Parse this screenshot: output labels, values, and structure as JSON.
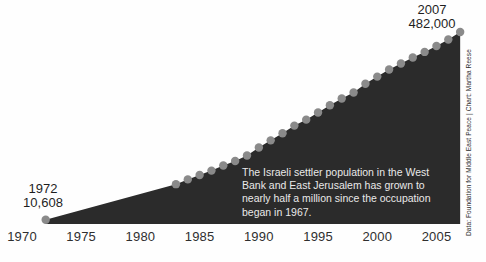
{
  "chart_data": {
    "type": "area",
    "title": "",
    "subtitle": "",
    "xlabel": "",
    "ylabel": "",
    "grid": false,
    "legend": false,
    "xlim": [
      1970,
      2008
    ],
    "ylim": [
      0,
      482000
    ],
    "x": [
      1972,
      1983,
      1984,
      1985,
      1986,
      1987,
      1988,
      1989,
      1990,
      1991,
      1992,
      1993,
      1994,
      1995,
      1996,
      1997,
      1998,
      1999,
      2000,
      2001,
      2002,
      2003,
      2004,
      2005,
      2006,
      2007
    ],
    "values": [
      10608,
      100000,
      112000,
      123000,
      134000,
      147000,
      158000,
      172000,
      192000,
      210000,
      228000,
      247000,
      262000,
      280000,
      298000,
      315000,
      330000,
      352000,
      370000,
      388000,
      403000,
      418000,
      432000,
      447000,
      463000,
      482000
    ],
    "series": [
      {
        "name": "Israeli settler population (West Bank and East Jerusalem)",
        "values": [
          10608,
          100000,
          112000,
          123000,
          134000,
          147000,
          158000,
          172000,
          192000,
          210000,
          228000,
          247000,
          262000,
          280000,
          298000,
          315000,
          330000,
          352000,
          370000,
          388000,
          403000,
          418000,
          432000,
          447000,
          463000,
          482000
        ]
      }
    ],
    "xticks": [
      "1970",
      "1975",
      "1980",
      "1985",
      "1990",
      "1995",
      "2000",
      "2005"
    ],
    "xtick_values": [
      1970,
      1975,
      1980,
      1985,
      1990,
      1995,
      2000,
      2005
    ],
    "annotations": [
      {
        "id": "start",
        "year": "1972",
        "value": "10,608"
      },
      {
        "id": "end",
        "year": "2007",
        "value": "482,000"
      }
    ],
    "caption": "The Israeli settler population in the West Bank and East Jerusalem has grown to nearly half a million since the occupation began in 1967.",
    "credit": "Data: Foundation for Middle East Peace | Chart: Martha Reese",
    "colors": {
      "area_fill": "#2b2b2b",
      "point": "#8a8a8a",
      "background": "#fefefe",
      "axis_label": "#2f2f2f",
      "annotation_text": "#1e1e1e",
      "caption_text": "#e9e9e9",
      "credit_text": "#2b2b2b"
    }
  }
}
